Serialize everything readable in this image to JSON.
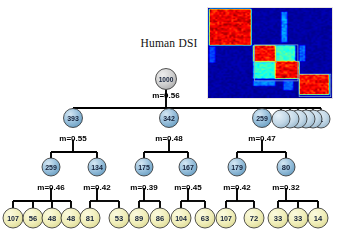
{
  "figure": {
    "heatmap_title": "Human DSI",
    "colors": {
      "root_node_fill": "#c9c9c9",
      "internal_node_fill": "#8fb8d6",
      "leaf_node_fill": "#f2f0c2",
      "node_stroke": "#2b2b2b",
      "edge_stroke": "#000000",
      "text": "#000000",
      "heatmap_background": "#10163c",
      "heatmap_hot": "#d81e05",
      "heatmap_warm": "#f5a800",
      "heatmap_cool": "#3fa9f5",
      "heatmap_box_outline": "#7fb2d8"
    },
    "levels": {
      "root": {
        "nodes": [
          {
            "id": "root",
            "label": "1000",
            "x": 166,
            "y": 79,
            "r": 10.5,
            "kind": "root"
          }
        ],
        "m_labels": [
          {
            "text": "m=0.56",
            "x": 166,
            "y": 98
          }
        ]
      },
      "level1": {
        "nodes": [
          {
            "id": "n393",
            "label": "393",
            "x": 73,
            "y": 118,
            "r": 9.5,
            "kind": "internal"
          },
          {
            "id": "n342",
            "label": "342",
            "x": 169,
            "y": 118,
            "r": 9.5,
            "kind": "internal"
          },
          {
            "id": "n259",
            "label": "259",
            "x": 262,
            "y": 118,
            "r": 9.5,
            "kind": "internal"
          },
          {
            "id": "singleton1",
            "label": "",
            "x": 281,
            "y": 119,
            "r": 9.0,
            "kind": "singleton"
          },
          {
            "id": "singleton2",
            "label": "",
            "x": 290,
            "y": 119,
            "r": 9.0,
            "kind": "singleton"
          },
          {
            "id": "singleton3",
            "label": "",
            "x": 298,
            "y": 119,
            "r": 9.0,
            "kind": "singleton"
          },
          {
            "id": "singleton4",
            "label": "",
            "x": 306,
            "y": 119,
            "r": 9.0,
            "kind": "singleton"
          },
          {
            "id": "singleton5",
            "label": "",
            "x": 313,
            "y": 119,
            "r": 9.0,
            "kind": "singleton"
          },
          {
            "id": "singleton6",
            "label": "1",
            "x": 321,
            "y": 119,
            "r": 9.0,
            "kind": "singleton"
          }
        ],
        "m_labels": [
          {
            "text": "m=0.55",
            "x": 73,
            "y": 141
          },
          {
            "text": "m=0.48",
            "x": 169,
            "y": 141
          },
          {
            "text": "m=0.47",
            "x": 262,
            "y": 141
          }
        ]
      },
      "level2": {
        "nodes": [
          {
            "id": "n259b",
            "label": "259",
            "x": 51,
            "y": 167,
            "r": 9.0,
            "kind": "internal"
          },
          {
            "id": "n134",
            "label": "134",
            "x": 97,
            "y": 167,
            "r": 9.0,
            "kind": "internal"
          },
          {
            "id": "n175",
            "label": "175",
            "x": 144,
            "y": 167,
            "r": 9.0,
            "kind": "internal"
          },
          {
            "id": "n167",
            "label": "167",
            "x": 188,
            "y": 167,
            "r": 9.0,
            "kind": "internal"
          },
          {
            "id": "n179",
            "label": "179",
            "x": 237,
            "y": 167,
            "r": 9.0,
            "kind": "internal"
          },
          {
            "id": "n80",
            "label": "80",
            "x": 286,
            "y": 167,
            "r": 9.0,
            "kind": "internal"
          }
        ],
        "m_labels": [
          {
            "text": "m=0.46",
            "x": 51,
            "y": 190
          },
          {
            "text": "m=0.42",
            "x": 97,
            "y": 190
          },
          {
            "text": "m=0.39",
            "x": 144,
            "y": 190
          },
          {
            "text": "m=0.45",
            "x": 188,
            "y": 190
          },
          {
            "text": "m=0.42",
            "x": 237,
            "y": 190
          },
          {
            "text": "m=0.32",
            "x": 286,
            "y": 190
          }
        ]
      },
      "leaves": {
        "nodes": [
          {
            "id": "l107a",
            "label": "107",
            "x": 13,
            "y": 218,
            "r": 10.0,
            "parent": "n259b"
          },
          {
            "id": "l56",
            "label": "56",
            "x": 33,
            "y": 218,
            "r": 10.0,
            "parent": "n259b"
          },
          {
            "id": "l48a",
            "label": "48",
            "x": 52,
            "y": 218,
            "r": 10.0,
            "parent": "n259b"
          },
          {
            "id": "l48b",
            "label": "48",
            "x": 71,
            "y": 218,
            "r": 10.0,
            "parent": "n259b"
          },
          {
            "id": "l81",
            "label": "81",
            "x": 90,
            "y": 218,
            "r": 10.0,
            "parent": "n134"
          },
          {
            "id": "l53",
            "label": "53",
            "x": 119,
            "y": 218,
            "r": 10.0,
            "parent": "n134"
          },
          {
            "id": "l89",
            "label": "89",
            "x": 139,
            "y": 218,
            "r": 10.0,
            "parent": "n175"
          },
          {
            "id": "l86",
            "label": "86",
            "x": 160,
            "y": 218,
            "r": 10.0,
            "parent": "n175"
          },
          {
            "id": "l104",
            "label": "104",
            "x": 181,
            "y": 218,
            "r": 10.0,
            "parent": "n167"
          },
          {
            "id": "l63",
            "label": "63",
            "x": 205,
            "y": 218,
            "r": 10.0,
            "parent": "n167"
          },
          {
            "id": "l107b",
            "label": "107",
            "x": 226,
            "y": 218,
            "r": 10.0,
            "parent": "n179"
          },
          {
            "id": "l72",
            "label": "72",
            "x": 254,
            "y": 218,
            "r": 10.0,
            "parent": "n179"
          },
          {
            "id": "l33a",
            "label": "33",
            "x": 278,
            "y": 218,
            "r": 10.0,
            "parent": "n80"
          },
          {
            "id": "l33b",
            "label": "33",
            "x": 298,
            "y": 218,
            "r": 10.0,
            "parent": "n80"
          },
          {
            "id": "l14",
            "label": "14",
            "x": 318,
            "y": 218,
            "r": 10.0,
            "parent": "n80"
          }
        ]
      }
    }
  },
  "chart_data": {
    "type": "diagram",
    "tree": {
      "label": "1000",
      "m": "m=0.56",
      "children": [
        {
          "label": "393",
          "m": "m=0.55",
          "children": [
            {
              "label": "259",
              "m": "m=0.46",
              "children": [
                {
                  "label": "107"
                },
                {
                  "label": "56"
                },
                {
                  "label": "48"
                },
                {
                  "label": "48"
                }
              ]
            },
            {
              "label": "134",
              "m": "m=0.42",
              "children": [
                {
                  "label": "81"
                },
                {
                  "label": "53"
                }
              ]
            }
          ]
        },
        {
          "label": "342",
          "m": "m=0.48",
          "children": [
            {
              "label": "175",
              "m": "m=0.39",
              "children": [
                {
                  "label": "89"
                },
                {
                  "label": "86"
                }
              ]
            },
            {
              "label": "167",
              "m": "m=0.45",
              "children": [
                {
                  "label": "104"
                },
                {
                  "label": "63"
                }
              ]
            }
          ]
        },
        {
          "label": "259",
          "m": "m=0.47",
          "children": [
            {
              "label": "179",
              "m": "m=0.42",
              "children": [
                {
                  "label": "107"
                },
                {
                  "label": "72"
                }
              ]
            },
            {
              "label": "80",
              "m": "m=0.32",
              "children": [
                {
                  "label": "33"
                },
                {
                  "label": "33"
                },
                {
                  "label": "14"
                }
              ]
            }
          ]
        },
        {
          "label": "1",
          "singletons": 6
        }
      ]
    },
    "heatmap": {
      "label": "Human DSI",
      "colormap": "jet",
      "background_value": "low",
      "blocks": [
        {
          "x0": 0.03,
          "y0": 0.04,
          "x1": 0.36,
          "y1": 0.42,
          "value": "high"
        },
        {
          "x0": 0.38,
          "y0": 0.42,
          "x1": 0.55,
          "y1": 0.6,
          "value": "high"
        },
        {
          "x0": 0.55,
          "y0": 0.42,
          "x1": 0.72,
          "y1": 0.6,
          "value": "mid-cool"
        },
        {
          "x0": 0.38,
          "y0": 0.6,
          "x1": 0.55,
          "y1": 0.78,
          "value": "mid-cool"
        },
        {
          "x0": 0.55,
          "y0": 0.6,
          "x1": 0.74,
          "y1": 0.8,
          "value": "high"
        },
        {
          "x0": 0.74,
          "y0": 0.74,
          "x1": 0.98,
          "y1": 0.97,
          "value": "high"
        }
      ]
    }
  }
}
